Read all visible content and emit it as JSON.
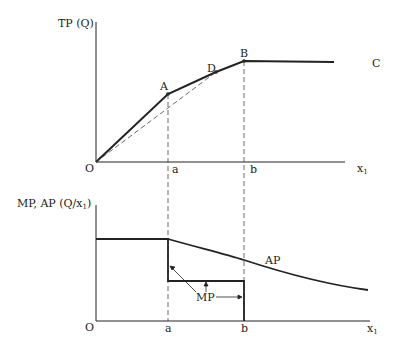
{
  "top_chart": {
    "y_axis_label": "TP (Q)",
    "origin_label": "O",
    "x_axis_label": "x",
    "x_axis_subscript": "1",
    "tick_a": "a",
    "tick_b": "b",
    "points": {
      "A": "A",
      "B": "B",
      "C": "C",
      "D": "D"
    }
  },
  "bottom_chart": {
    "y_axis_label": "MP, AP (Q/x",
    "y_axis_subscript": "1",
    "y_axis_label_end": ")",
    "origin_label": "O",
    "x_axis_label": "x",
    "x_axis_subscript": "1",
    "tick_a": "a",
    "tick_b": "b",
    "ap_label": "AP",
    "mp_label": "MP"
  },
  "colors": {
    "line": "#222222",
    "dashed": "#444444",
    "background": "#ffffff"
  }
}
